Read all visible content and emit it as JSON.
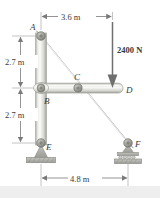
{
  "figure": {
    "background_color": "#ffffff",
    "member_color": "#d8d8d4",
    "line_color": "#8a8a8a",
    "text_color": "#3a3a3a"
  },
  "dimensions": {
    "top": {
      "label": "3.6 m",
      "value": 3.6,
      "unit": "m",
      "orientation": "horizontal"
    },
    "left_upper": {
      "label": "2.7 m",
      "value": 2.7,
      "unit": "m",
      "orientation": "vertical"
    },
    "left_lower": {
      "label": "2.7 m",
      "value": 2.7,
      "unit": "m",
      "orientation": "vertical"
    },
    "bottom": {
      "label": "4.8 m",
      "value": 4.8,
      "unit": "m",
      "orientation": "horizontal"
    }
  },
  "load": {
    "label": "2400 N",
    "magnitude": 2400,
    "unit": "N",
    "direction": "down",
    "applied_at": "D"
  },
  "joints": {
    "a": {
      "label": "A",
      "type": "pin"
    },
    "b": {
      "label": "B",
      "type": "pin"
    },
    "c": {
      "label": "C",
      "type": "pin"
    },
    "d": {
      "label": "D",
      "type": "free-end"
    },
    "e": {
      "label": "E",
      "type": "pin-support"
    },
    "f": {
      "label": "F",
      "type": "roller-support"
    }
  },
  "members": {
    "ae": {
      "name": "vertical-member-AE"
    },
    "af": {
      "name": "diagonal-member-AF"
    },
    "bd": {
      "name": "horizontal-member-BD"
    }
  },
  "supports": {
    "e": {
      "name": "pin-support-E",
      "kind": "pin"
    },
    "f": {
      "name": "roller-support-F",
      "kind": "roller"
    }
  }
}
